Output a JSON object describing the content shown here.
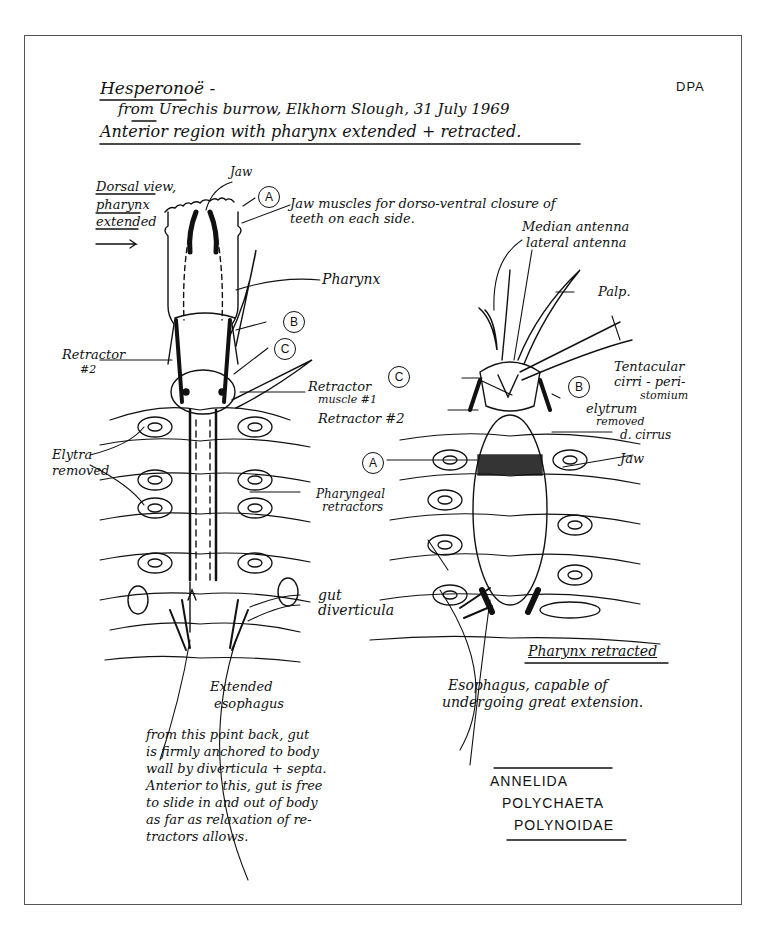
{
  "header": {
    "title": "Hesperonoë -",
    "line1": "from Urechis burrow, Elkhorn Slough, 31 July 1969",
    "line2": "Anterior region with pharynx extended + retracted.",
    "initials": "DPA"
  },
  "left_view": {
    "caption": [
      "Dorsal view,",
      "pharynx",
      "extended"
    ],
    "labels": {
      "jaw": "Jaw",
      "jaw_muscles": "Jaw muscles for dorso-ventral closure of",
      "jaw_muscles_2": "teeth on each side.",
      "pharynx": "Pharynx",
      "retractor2": "Retractor",
      "retractor2_num": "#2",
      "elytra": "Elytra",
      "elytra_2": "removed",
      "retractor1": "Retractor",
      "retractor1_2": "muscle #1",
      "pharyngeal": "Pharyngeal",
      "pharyngeal_2": "retractors",
      "gut": "gut",
      "gut_2": "diverticula",
      "ext_esoph": "Extended",
      "ext_esoph_2": "esophagus"
    }
  },
  "right_view": {
    "labels": {
      "median": "Median antenna",
      "lateral": "lateral antenna",
      "palp": "Palp.",
      "tentacular": "Tentacular",
      "tentacular_2": "cirri - peri-",
      "tentacular_3": "stomium",
      "elytrum": "elytrum",
      "elytrum_2": "removed",
      "retractor2": "Retractor #2",
      "dcirrus": "d. cirrus",
      "jaw": "Jaw",
      "retracted": "Pharynx retracted",
      "esoph": "Esophagus, capable of",
      "esoph_2": "undergoing great extension."
    }
  },
  "markers": [
    "A",
    "B",
    "C"
  ],
  "note": "from this point back, gut\nis firmly anchored to body\nwall by diverticula + septa.\n   Anterior to this, gut is free\nto slide in and out of body\nas far as relaxation of re-\ntractors allows.",
  "taxonomy": {
    "phylum": "ANNELIDA",
    "class": "POLYCHAETA",
    "family": "POLYNOIDAE"
  }
}
